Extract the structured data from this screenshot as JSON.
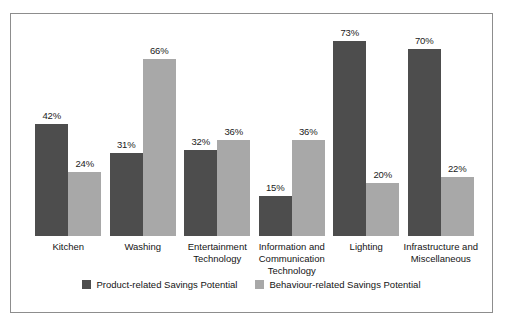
{
  "chart_data": {
    "type": "bar",
    "title": "",
    "subtitle": "",
    "xlabel": "",
    "ylabel": "",
    "ylim": [
      0,
      80
    ],
    "grid": false,
    "legend_position": "bottom-center",
    "categories": [
      "Kitchen",
      "Washing",
      "Entertainment\nTechnology",
      "Information and\nCommunication\nTechnology",
      "Lighting",
      "Infrastructure and\nMiscellaneous"
    ],
    "series": [
      {
        "name": "Product-related Savings Potential",
        "color": "#4d4d4d",
        "values": [
          42,
          31,
          32,
          15,
          73,
          70
        ],
        "labels": [
          "42%",
          "31%",
          "32%",
          "15%",
          "73%",
          "70%"
        ]
      },
      {
        "name": "Behaviour-related Savings Potential",
        "color": "#a8a8a8",
        "values": [
          24,
          66,
          36,
          36,
          20,
          22
        ],
        "labels": [
          "24%",
          "66%",
          "36%",
          "36%",
          "20%",
          "22%"
        ]
      }
    ]
  },
  "legend": {
    "items": [
      {
        "label": "Product-related Savings Potential",
        "swatch": "product"
      },
      {
        "label": "Behaviour-related Savings Potential",
        "swatch": "behaviour"
      }
    ]
  }
}
